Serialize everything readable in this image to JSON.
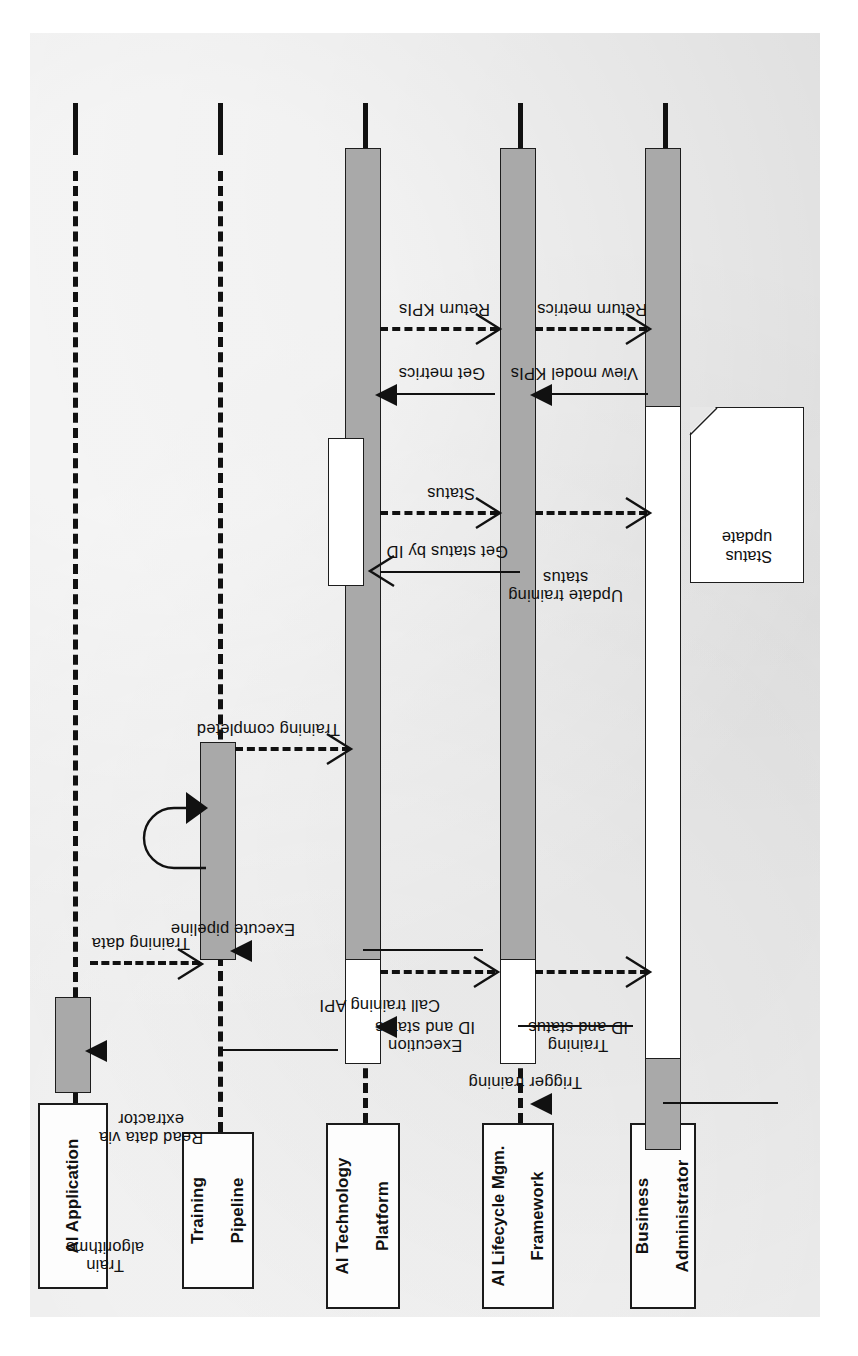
{
  "diagram": {
    "type": "uml-sequence-diagram",
    "orientation": "rotated-90-ccw",
    "colors": {
      "page_background": "#ffffff",
      "figure_background": "#e7e7e7",
      "activation_gray": "#a9a9a9",
      "activation_white": "#ffffff",
      "line": "#111111",
      "participant_fill": "#fdfdfd"
    }
  },
  "participants": [
    {
      "id": "biz",
      "label": "Business\nAdministrator",
      "line1": "Business",
      "line2": "Administrator"
    },
    {
      "id": "almf",
      "label": "AI Lifecycle Mgm.\nFramework",
      "line1": "AI Lifecycle Mgm.",
      "line2": "Framework"
    },
    {
      "id": "platform",
      "label": "AI Technology\nPlatform",
      "line1": "AI Technology",
      "line2": "Platform"
    },
    {
      "id": "pipeline",
      "label": "Training\nPipeline",
      "line1": "Training",
      "line2": "Pipeline"
    },
    {
      "id": "app",
      "label": "AI Application",
      "line1": "AI Application",
      "line2": ""
    }
  ],
  "messages": [
    {
      "id": "m1",
      "label": "Trigger training",
      "line1": "Trigger training",
      "line2": "",
      "from": "biz",
      "to": "almf",
      "style": "solid",
      "arrow": "filled"
    },
    {
      "id": "m2",
      "label": "Call training API",
      "line1": "Call training API",
      "line2": "",
      "from": "almf",
      "to": "platform",
      "style": "solid",
      "arrow": "filled"
    },
    {
      "id": "m3",
      "label": "Execute pipeline",
      "line1": "Execute pipeline",
      "line2": "",
      "from": "platform",
      "to": "pipeline",
      "style": "solid",
      "arrow": "filled"
    },
    {
      "id": "m4",
      "label": "Read data via extractor",
      "line1": "Read data via",
      "line2": "extractor",
      "from": "pipeline",
      "to": "app",
      "style": "solid",
      "arrow": "filled"
    },
    {
      "id": "m5",
      "label": "Training data",
      "line1": "Training data",
      "line2": "",
      "from": "app",
      "to": "pipeline",
      "style": "dashed",
      "arrow": "open"
    },
    {
      "id": "m6",
      "label": "Train algorithms",
      "line1": "Train",
      "line2": "algorithms",
      "from": "pipeline",
      "to": "pipeline",
      "style": "solid",
      "arrow": "filled",
      "self": true
    },
    {
      "id": "m7",
      "label": "Training completed",
      "line1": "Training completed",
      "line2": "",
      "from": "pipeline",
      "to": "platform",
      "style": "dashed",
      "arrow": "open"
    },
    {
      "id": "m8",
      "label": "Execution ID and status",
      "line1": "Execution",
      "line2": "ID and status",
      "from": "platform",
      "to": "almf",
      "style": "dashed",
      "arrow": "open"
    },
    {
      "id": "m9",
      "label": "Training ID and status",
      "line1": "Training",
      "line2": "ID and status",
      "from": "almf",
      "to": "biz",
      "style": "dashed",
      "arrow": "open"
    },
    {
      "id": "m10",
      "label": "Get status by ID",
      "line1": "Get status by ID",
      "line2": "",
      "from": "almf",
      "to": "platform",
      "style": "solid",
      "arrow": "open"
    },
    {
      "id": "m11",
      "label": "Status",
      "line1": "Status",
      "line2": "",
      "from": "platform",
      "to": "almf",
      "style": "dashed",
      "arrow": "open"
    },
    {
      "id": "m12",
      "label": "Update training status",
      "line1": "Update training",
      "line2": "status",
      "from": "almf",
      "to": "biz",
      "style": "dashed",
      "arrow": "open"
    },
    {
      "id": "m13",
      "label": "View model KPIs",
      "line1": "View model KPIs",
      "line2": "",
      "from": "biz",
      "to": "almf",
      "style": "solid",
      "arrow": "filled"
    },
    {
      "id": "m14",
      "label": "Get metrics",
      "line1": "Get metrics",
      "line2": "",
      "from": "almf",
      "to": "platform",
      "style": "solid",
      "arrow": "filled"
    },
    {
      "id": "m15",
      "label": "Return KPIs",
      "line1": "Return KPIs",
      "line2": "",
      "from": "platform",
      "to": "almf",
      "style": "dashed",
      "arrow": "open"
    },
    {
      "id": "m16",
      "label": "Return metrics",
      "line1": "Return metrics",
      "line2": "",
      "from": "almf",
      "to": "biz",
      "style": "dashed",
      "arrow": "open"
    }
  ],
  "notes": [
    {
      "id": "n1",
      "line1": "Status",
      "line2": "update",
      "label": "Status update",
      "attached_to": "biz"
    }
  ]
}
